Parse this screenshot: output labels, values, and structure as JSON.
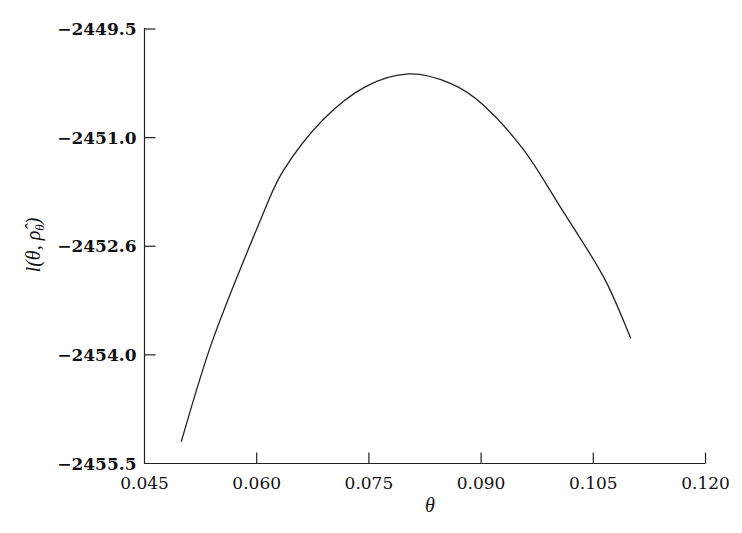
{
  "chart_data": {
    "type": "line",
    "title": "",
    "xlabel": "θ",
    "ylabel": "l(θ, ρ̂_θ)",
    "xlim": [
      0.045,
      0.12
    ],
    "ylim": [
      -2455.5,
      -2449.5
    ],
    "grid": false,
    "legend": null,
    "x_ticks": [
      "0.045",
      "0.060",
      "0.075",
      "0.090",
      "0.105",
      "0.120"
    ],
    "y_ticks": [
      "−2449.5",
      "−2451.0",
      "−2452.6",
      "−2454.0",
      "−2455.5"
    ],
    "series": [
      {
        "name": "profile log-likelihood",
        "x": [
          0.0499,
          0.0541,
          0.0605,
          0.0636,
          0.0688,
          0.0745,
          0.0803,
          0.0859,
          0.0903,
          0.0957,
          0.1006,
          0.1064,
          0.11
        ],
        "y": [
          -2455.2,
          -2453.8,
          -2452.14,
          -2451.45,
          -2450.76,
          -2450.3,
          -2450.12,
          -2450.25,
          -2450.55,
          -2451.17,
          -2451.96,
          -2452.93,
          -2453.77
        ]
      }
    ]
  },
  "axes": {
    "x_title": "θ",
    "y_title_main": "l(θ, ",
    "y_title_rho": "ρ̂",
    "y_title_sub": "θ",
    "y_title_close": ")"
  }
}
